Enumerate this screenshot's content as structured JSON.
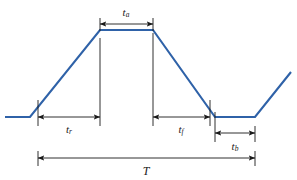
{
  "figure": {
    "background_color": "#ffffff",
    "waveform_color": "#2f62a8",
    "annotation_color": "#1a1a1a",
    "waveform_stroke_width": 2.1,
    "annotation_stroke_width": 0.9
  },
  "labels": {
    "t_a": {
      "base": "t",
      "sub": "a",
      "x": 126,
      "y": 16,
      "font_size": 11
    },
    "t_r": {
      "base": "t",
      "sub": "r",
      "x": 69,
      "y": 133,
      "font_size": 11
    },
    "t_f": {
      "base": "t",
      "sub": "f",
      "x": 181,
      "y": 133,
      "font_size": 11
    },
    "t_b": {
      "base": "t",
      "sub": "b",
      "x": 235,
      "y": 150,
      "font_size": 11
    },
    "T": {
      "base": "T",
      "sub": "",
      "x": 146,
      "y": 175,
      "font_size": 12
    }
  },
  "chart_data": {
    "type": "line",
    "xlabel": "",
    "ylabel": "",
    "grid": false,
    "legend": null,
    "series": [
      {
        "name": "trapezoidal-pulse",
        "color": "#2f62a8",
        "points": [
          [
            5,
            117
          ],
          [
            30,
            117
          ],
          [
            100,
            30
          ],
          [
            153,
            30
          ],
          [
            215,
            117
          ],
          [
            255,
            117
          ],
          [
            291,
            72
          ]
        ]
      }
    ],
    "segments": [
      {
        "name": "initial-low-level",
        "from_x": 5,
        "to_x": 30,
        "level": "low"
      },
      {
        "name": "rising-edge",
        "from_x": 30,
        "to_x": 100,
        "level": "ramp-up"
      },
      {
        "name": "plateau-high-level",
        "from_x": 100,
        "to_x": 153,
        "level": "high"
      },
      {
        "name": "falling-edge",
        "from_x": 153,
        "to_x": 215,
        "level": "ramp-down"
      },
      {
        "name": "base-low-level",
        "from_x": 215,
        "to_x": 255,
        "level": "low"
      },
      {
        "name": "next-rising-edge",
        "from_x": 255,
        "to_x": 291,
        "level": "ramp-up"
      }
    ],
    "dimensions": [
      {
        "name": "t_a",
        "label": "t_a",
        "description": "pulse top (advance) duration",
        "x1": 100,
        "x2": 153,
        "y": 24
      },
      {
        "name": "t_r",
        "label": "t_r",
        "description": "rise time",
        "x1": 38,
        "x2": 100,
        "y": 117
      },
      {
        "name": "t_f",
        "label": "t_f",
        "description": "fall time",
        "x1": 153,
        "x2": 210,
        "y": 117
      },
      {
        "name": "t_b",
        "label": "t_b",
        "description": "base (dwell) duration",
        "x1": 215,
        "x2": 255,
        "y": 133
      },
      {
        "name": "T",
        "label": "T",
        "description": "total period",
        "x1": 38,
        "x2": 255,
        "y": 158
      }
    ],
    "leader_lines": [
      {
        "name": "leader-rise-start",
        "x": 38,
        "y1": 100,
        "y2": 126
      },
      {
        "name": "leader-rise-end",
        "x": 100,
        "y1": 38,
        "y2": 126
      },
      {
        "name": "leader-fall-start",
        "x": 153,
        "y1": 33,
        "y2": 126
      },
      {
        "name": "leader-fall-end",
        "x": 210,
        "y1": 100,
        "y2": 126
      },
      {
        "name": "leader-ta-left",
        "x": 100,
        "y1": 18,
        "y2": 31
      },
      {
        "name": "leader-ta-right",
        "x": 153,
        "y1": 18,
        "y2": 31
      },
      {
        "name": "leader-tb-left",
        "x": 215,
        "y1": 112,
        "y2": 142
      },
      {
        "name": "leader-tb-right",
        "x": 255,
        "y1": 126,
        "y2": 142
      },
      {
        "name": "leader-period-left",
        "x": 38,
        "y1": 151,
        "y2": 166
      },
      {
        "name": "leader-period-right",
        "x": 255,
        "y1": 151,
        "y2": 166
      }
    ],
    "axis_note": "No numeric axes; purely schematic timing dimensions."
  }
}
